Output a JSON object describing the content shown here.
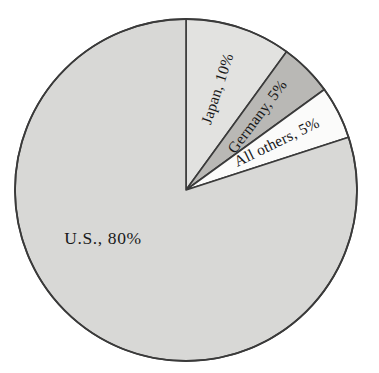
{
  "chart_data": {
    "type": "pie",
    "title": "",
    "subtitle": "",
    "xlabel": "",
    "ylabel": "",
    "legend_position": "none",
    "grid": false,
    "units": "percent",
    "total": 100,
    "start_angle_deg": 0,
    "direction": "clockwise",
    "categories": [
      "Japan",
      "Germany",
      "All others",
      "U.S."
    ],
    "values": [
      10,
      5,
      5,
      80
    ],
    "labels": [
      "Japan, 10%",
      "Germany, 5%",
      "All others, 5%",
      "U.S., 80%"
    ],
    "slices": [
      {
        "name": "Japan",
        "value": 10,
        "label": "Japan, 10%",
        "color": "#e2e2e0",
        "start_deg": 0,
        "end_deg": 36,
        "label_rotation_deg": -72,
        "label_radius_frac": 0.62
      },
      {
        "name": "Germany",
        "value": 5,
        "label": "Germany, 5%",
        "color": "#b9b8b5",
        "start_deg": 36,
        "end_deg": 54,
        "label_rotation_deg": -53,
        "label_radius_frac": 0.6
      },
      {
        "name": "All others",
        "value": 5,
        "label": "All others, 5%",
        "color": "#fbfbfa",
        "start_deg": 54,
        "end_deg": 72,
        "label_rotation_deg": -26,
        "label_radius_frac": 0.6
      },
      {
        "name": "U.S.",
        "value": 80,
        "label": "U.S., 80%",
        "color": "#d8d8d6",
        "start_deg": 72,
        "end_deg": 360,
        "label_rotation_deg": 0,
        "label_radius_frac": 0.6
      }
    ]
  },
  "figure": {
    "background_color": "#ffffff",
    "outline_color": "#3a3a3a",
    "center_x": 186,
    "center_y": 190,
    "radius": 171
  }
}
